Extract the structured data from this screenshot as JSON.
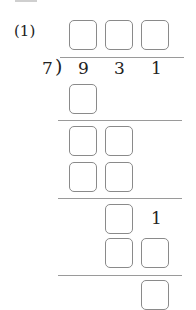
{
  "problem": {
    "label": "(1)",
    "divisor": "7",
    "bracket": ")",
    "dividend": [
      "9",
      "3",
      "1"
    ],
    "step_digit": "1"
  },
  "answer_boxes": {
    "quotient": 3,
    "step1": 1,
    "step2_remainder": 2,
    "step2_product": 2,
    "step3_remainder": 1,
    "step3_product": 2,
    "final_remainder": 1
  },
  "colors": {
    "box_border": "#8a8a8a",
    "rule": "#9a9a9a",
    "text": "#222222"
  }
}
